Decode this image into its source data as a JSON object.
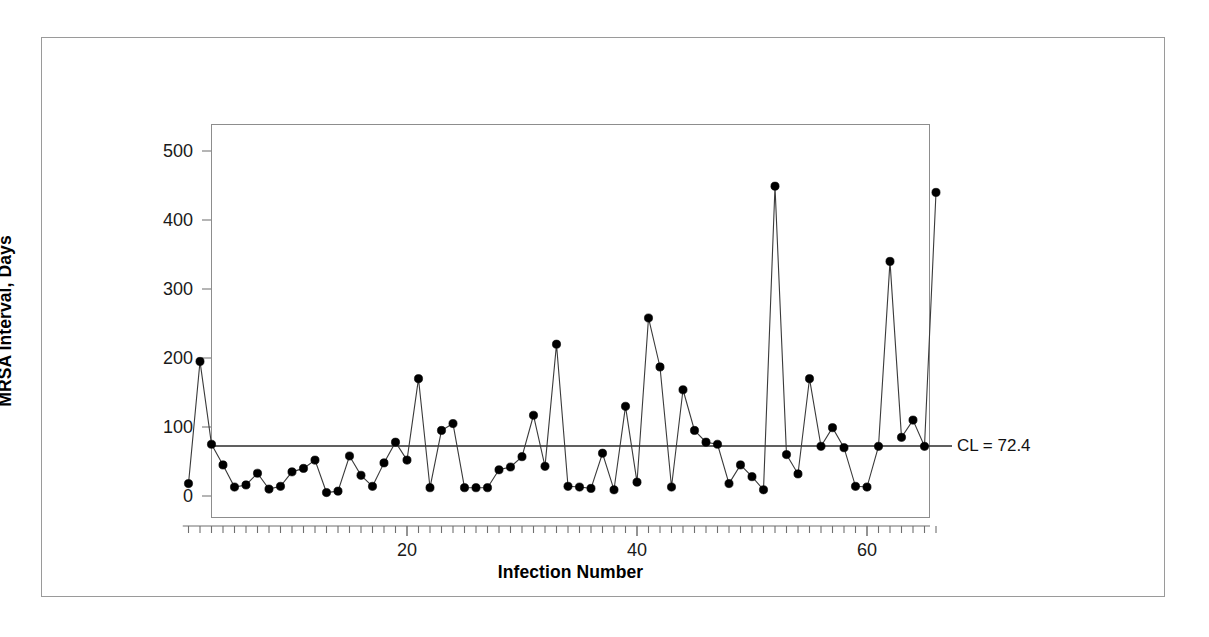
{
  "chart_data": {
    "type": "line",
    "title": "",
    "subtitle": "",
    "xlabel": "Infection Number",
    "ylabel": "MRSA Interval, Days",
    "xlim": [
      1,
      66
    ],
    "ylim": [
      0,
      540
    ],
    "x_ticks": [
      20,
      40,
      60
    ],
    "y_ticks": [
      0,
      100,
      200,
      300,
      400,
      500
    ],
    "grid": false,
    "legend": "none",
    "marker": "filled-circle",
    "annotations": [
      {
        "name": "center-line",
        "label": "CL = 72.4",
        "value": 72.4,
        "orientation": "horizontal"
      }
    ],
    "x": [
      1,
      2,
      3,
      4,
      5,
      6,
      7,
      8,
      9,
      10,
      11,
      12,
      13,
      14,
      15,
      16,
      17,
      18,
      19,
      20,
      21,
      22,
      23,
      24,
      25,
      26,
      27,
      28,
      29,
      30,
      31,
      32,
      33,
      34,
      35,
      36,
      37,
      38,
      39,
      40,
      41,
      42,
      43,
      44,
      45,
      46,
      47,
      48,
      49,
      50,
      51,
      52,
      53,
      54,
      55,
      56,
      57,
      58,
      59,
      60,
      61,
      62,
      63,
      64,
      65,
      66
    ],
    "values": [
      18,
      195,
      75,
      45,
      13,
      16,
      33,
      10,
      14,
      35,
      40,
      52,
      5,
      7,
      58,
      30,
      14,
      48,
      78,
      52,
      170,
      12,
      95,
      105,
      12,
      12,
      12,
      38,
      42,
      57,
      117,
      43,
      220,
      14,
      13,
      11,
      62,
      9,
      130,
      20,
      258,
      187,
      13,
      154,
      95,
      78,
      75,
      18,
      45,
      28,
      9,
      449,
      60,
      32,
      170,
      72,
      99,
      70,
      14,
      13,
      72,
      340,
      85,
      110,
      72,
      440
    ],
    "series": [
      {
        "name": "MRSA Interval, Days",
        "values": [
          18,
          195,
          75,
          45,
          13,
          16,
          33,
          10,
          14,
          35,
          40,
          52,
          5,
          7,
          58,
          30,
          14,
          48,
          78,
          52,
          170,
          12,
          95,
          105,
          12,
          12,
          12,
          38,
          42,
          57,
          117,
          43,
          220,
          14,
          13,
          11,
          62,
          9,
          130,
          20,
          258,
          187,
          13,
          154,
          95,
          78,
          75,
          18,
          45,
          28,
          9,
          449,
          60,
          32,
          170,
          72,
          99,
          70,
          14,
          13,
          72,
          340,
          85,
          110,
          72,
          440
        ]
      }
    ],
    "center_line_value": 72.4,
    "n_points": 66
  },
  "axis": {
    "y_title": "MRSA Interval, Days",
    "x_title": "Infection Number",
    "y_tick_labels": [
      "0",
      "100",
      "200",
      "300",
      "400",
      "500"
    ],
    "x_tick_labels": [
      "20",
      "40",
      "60"
    ]
  },
  "annotation": {
    "cl_text": "CL = 72.4"
  },
  "colors": {
    "line": "#3a3a3a",
    "marker": "#000000",
    "center_line": "#2b2b2b",
    "frame": "#8d8d8d",
    "outer_border": "#9a9a9a",
    "text": "#000000",
    "background": "#ffffff"
  }
}
